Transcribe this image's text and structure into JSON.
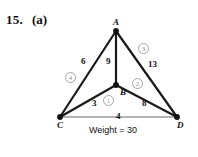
{
  "problem": {
    "number": "15.",
    "part": "(a)"
  },
  "figure": {
    "caption": "Weight = 30",
    "nodes": [
      {
        "id": "A",
        "label": "A",
        "x": 116,
        "y": 31
      },
      {
        "id": "B",
        "label": "B",
        "x": 116,
        "y": 85
      },
      {
        "id": "C",
        "label": "C",
        "x": 60,
        "y": 117
      },
      {
        "id": "D",
        "label": "D",
        "x": 177,
        "y": 117
      }
    ],
    "edges": [
      {
        "from": "A",
        "to": "C",
        "weight": "6",
        "selected": true,
        "order": "4"
      },
      {
        "from": "A",
        "to": "B",
        "weight": "9",
        "selected": true,
        "order": ""
      },
      {
        "from": "A",
        "to": "D",
        "weight": "13",
        "selected": true,
        "order": "3"
      },
      {
        "from": "C",
        "to": "B",
        "weight": "3",
        "selected": true,
        "order": "1"
      },
      {
        "from": "B",
        "to": "D",
        "weight": "8",
        "selected": true,
        "order": "2"
      },
      {
        "from": "C",
        "to": "D",
        "weight": "4",
        "selected": false,
        "order": ""
      }
    ],
    "colors": {
      "edge_selected": "#1a1a1a",
      "edge_unselected": "#9a9a9a",
      "node_fill": "#111111",
      "badge_stroke": "#a6a6a6",
      "badge_text": "#8f8f8f"
    }
  }
}
